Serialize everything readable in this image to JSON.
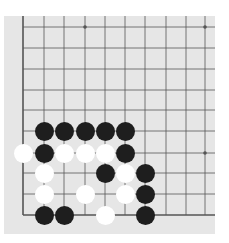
{
  "board": {
    "size_shown": {
      "cols": 10,
      "rows": 10
    },
    "corner": "bottom-left",
    "grid": {
      "x": [
        23,
        44,
        64,
        85,
        105,
        125,
        145,
        166,
        186,
        205
      ],
      "y": [
        27,
        48,
        69,
        90,
        110,
        131,
        153,
        173,
        194,
        215
      ]
    },
    "edges": {
      "left": true,
      "bottom": true
    },
    "star_points": [
      [
        3,
        0
      ],
      [
        9,
        0
      ],
      [
        9,
        6
      ]
    ],
    "colors": {
      "board": "#e6e6e6",
      "line": "#555555",
      "black": "#1e1e1e",
      "white": "#ffffff"
    },
    "stones": [
      {
        "color": "black",
        "col": 1,
        "row": 5
      },
      {
        "color": "black",
        "col": 2,
        "row": 5
      },
      {
        "color": "black",
        "col": 3,
        "row": 5
      },
      {
        "color": "black",
        "col": 4,
        "row": 5
      },
      {
        "color": "black",
        "col": 5,
        "row": 5
      },
      {
        "color": "white",
        "col": 0,
        "row": 6
      },
      {
        "color": "black",
        "col": 1,
        "row": 6
      },
      {
        "color": "white",
        "col": 2,
        "row": 6
      },
      {
        "color": "white",
        "col": 3,
        "row": 6
      },
      {
        "color": "white",
        "col": 4,
        "row": 6
      },
      {
        "color": "black",
        "col": 5,
        "row": 6
      },
      {
        "color": "white",
        "col": 1,
        "row": 7
      },
      {
        "color": "black",
        "col": 4,
        "row": 7
      },
      {
        "color": "white",
        "col": 5,
        "row": 7
      },
      {
        "color": "black",
        "col": 6,
        "row": 7
      },
      {
        "color": "white",
        "col": 1,
        "row": 8
      },
      {
        "color": "white",
        "col": 3,
        "row": 8
      },
      {
        "color": "white",
        "col": 5,
        "row": 8
      },
      {
        "color": "black",
        "col": 6,
        "row": 8
      },
      {
        "color": "black",
        "col": 1,
        "row": 9
      },
      {
        "color": "black",
        "col": 2,
        "row": 9
      },
      {
        "color": "white",
        "col": 4,
        "row": 9
      },
      {
        "color": "black",
        "col": 6,
        "row": 9
      }
    ]
  }
}
